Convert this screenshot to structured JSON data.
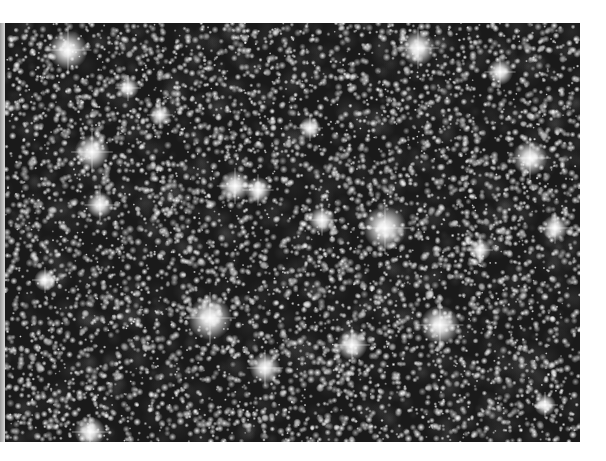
{
  "image": {
    "subject": "dense star field",
    "tone": "grayscale",
    "frame": {
      "x": 5,
      "y": 23,
      "width": 575,
      "height": 419
    },
    "background_color": "#1a1a1a",
    "page_color": "#ffffff",
    "star_color": "#ffffff",
    "bright_stars": [
      {
        "x": 68,
        "y": 50,
        "r": 9
      },
      {
        "x": 92,
        "y": 152,
        "r": 8
      },
      {
        "x": 100,
        "y": 205,
        "r": 6
      },
      {
        "x": 128,
        "y": 88,
        "r": 5
      },
      {
        "x": 235,
        "y": 186,
        "r": 7
      },
      {
        "x": 258,
        "y": 190,
        "r": 6
      },
      {
        "x": 322,
        "y": 220,
        "r": 6
      },
      {
        "x": 385,
        "y": 228,
        "r": 10
      },
      {
        "x": 210,
        "y": 318,
        "r": 10
      },
      {
        "x": 265,
        "y": 368,
        "r": 7
      },
      {
        "x": 440,
        "y": 325,
        "r": 9
      },
      {
        "x": 352,
        "y": 345,
        "r": 7
      },
      {
        "x": 418,
        "y": 48,
        "r": 8
      },
      {
        "x": 530,
        "y": 158,
        "r": 8
      },
      {
        "x": 555,
        "y": 228,
        "r": 6
      },
      {
        "x": 500,
        "y": 72,
        "r": 6
      },
      {
        "x": 480,
        "y": 250,
        "r": 5
      },
      {
        "x": 90,
        "y": 432,
        "r": 7
      },
      {
        "x": 545,
        "y": 405,
        "r": 5
      },
      {
        "x": 160,
        "y": 115,
        "r": 5
      },
      {
        "x": 310,
        "y": 128,
        "r": 5
      },
      {
        "x": 45,
        "y": 280,
        "r": 5
      }
    ],
    "faint_star_count": 6500,
    "seed": 42
  }
}
